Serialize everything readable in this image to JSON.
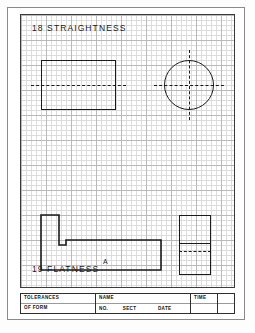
{
  "sheet": {
    "background_color": "#ffffff",
    "border_color": "#8a8a8a",
    "grid_border_color": "#3b3b3b",
    "grid_major_color": "#b9b9b9",
    "grid_minor_color": "#dcdcdc",
    "ink_color": "#1a1a1a"
  },
  "headings": {
    "straightness": "18  STRAIGHTNESS",
    "flatness": "19  FLATNESS"
  },
  "drawing": {
    "top_left_view_name": "rectangle-with-centerline",
    "top_right_view_name": "circle-with-crosshair-centerlines",
    "bottom_left_view_name": "stepped-block-profile",
    "bottom_right_view_name": "end-view-with-hidden-line",
    "part_label": "A"
  },
  "title_block": {
    "tolerances_line1": "TOLERANCES",
    "tolerances_line2": "OF FORM",
    "name_label": "NAME",
    "no_label": "NO.",
    "sect_label": "SECT",
    "date_label": "DATE",
    "time_label": "TIME",
    "blank_label": ""
  }
}
